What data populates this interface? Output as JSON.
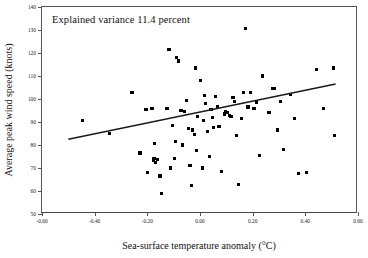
{
  "chart_data": {
    "type": "scatter",
    "title": "",
    "annotation": "Explained variance 11.4 percent",
    "xlabel": "Sea-surface temperature anomaly (°C)",
    "ylabel": "Average peak wind speed (knots)",
    "xlim": [
      -0.6,
      0.6
    ],
    "ylim": [
      50,
      140
    ],
    "xticks": [
      "-0.60",
      "-0.40",
      "-0.20",
      "0.00",
      "0.20",
      "0.40",
      "0.60"
    ],
    "xtick_values": [
      -0.6,
      -0.4,
      -0.2,
      0.0,
      0.2,
      0.4,
      0.6
    ],
    "yticks": [
      "50",
      "60",
      "70",
      "80",
      "90",
      "100",
      "110",
      "120",
      "130",
      "140"
    ],
    "ytick_values": [
      50,
      60,
      70,
      80,
      90,
      100,
      110,
      120,
      130,
      140
    ],
    "grid": false,
    "legend": false,
    "marker": "square",
    "marker_color": "#000000",
    "trendline": {
      "label": "linear-regression-line",
      "color": "#1a1a1a",
      "x_start": -0.5,
      "y_start": 82.5,
      "x_end": 0.515,
      "y_end": 106.5
    },
    "points": [
      [
        -0.445,
        90.5
      ],
      [
        -0.345,
        85.0
      ],
      [
        -0.258,
        103.0
      ],
      [
        -0.228,
        76.5
      ],
      [
        -0.205,
        95.5
      ],
      [
        -0.198,
        68.0
      ],
      [
        -0.182,
        96.0
      ],
      [
        -0.178,
        73.5
      ],
      [
        -0.175,
        74.0
      ],
      [
        -0.172,
        80.5
      ],
      [
        -0.168,
        72.5
      ],
      [
        -0.162,
        73.8
      ],
      [
        -0.152,
        66.5
      ],
      [
        -0.147,
        59.0
      ],
      [
        -0.125,
        96.0
      ],
      [
        -0.118,
        121.5
      ],
      [
        -0.112,
        70.0
      ],
      [
        -0.105,
        88.5
      ],
      [
        -0.098,
        74.0
      ],
      [
        -0.092,
        81.5
      ],
      [
        -0.088,
        118.0
      ],
      [
        -0.082,
        116.5
      ],
      [
        -0.072,
        95.0
      ],
      [
        -0.065,
        80.0
      ],
      [
        -0.058,
        94.5
      ],
      [
        -0.052,
        99.5
      ],
      [
        -0.045,
        87.0
      ],
      [
        -0.038,
        71.0
      ],
      [
        -0.032,
        62.5
      ],
      [
        -0.028,
        86.5
      ],
      [
        -0.022,
        84.5
      ],
      [
        -0.018,
        113.5
      ],
      [
        -0.012,
        77.5
      ],
      [
        -0.008,
        92.5
      ],
      [
        0.002,
        108.0
      ],
      [
        0.008,
        70.0
      ],
      [
        0.012,
        90.5
      ],
      [
        0.018,
        101.5
      ],
      [
        0.022,
        98.0
      ],
      [
        0.028,
        86.0
      ],
      [
        0.035,
        75.0
      ],
      [
        0.042,
        95.5
      ],
      [
        0.048,
        92.0
      ],
      [
        0.052,
        87.5
      ],
      [
        0.058,
        101.0
      ],
      [
        0.065,
        96.5
      ],
      [
        0.072,
        88.0
      ],
      [
        0.082,
        68.5
      ],
      [
        0.092,
        93.5
      ],
      [
        0.098,
        94.5
      ],
      [
        0.105,
        94.0
      ],
      [
        0.112,
        93.0
      ],
      [
        0.118,
        92.5
      ],
      [
        0.125,
        100.5
      ],
      [
        0.132,
        99.0
      ],
      [
        0.138,
        84.0
      ],
      [
        0.145,
        63.0
      ],
      [
        0.158,
        91.5
      ],
      [
        0.165,
        103.0
      ],
      [
        0.172,
        130.5
      ],
      [
        0.182,
        96.5
      ],
      [
        0.192,
        103.0
      ],
      [
        0.205,
        96.0
      ],
      [
        0.215,
        98.5
      ],
      [
        0.225,
        75.5
      ],
      [
        0.238,
        110.0
      ],
      [
        0.262,
        94.0
      ],
      [
        0.275,
        104.5
      ],
      [
        0.282,
        104.5
      ],
      [
        0.295,
        86.5
      ],
      [
        0.305,
        99.0
      ],
      [
        0.318,
        78.0
      ],
      [
        0.345,
        102.0
      ],
      [
        0.358,
        91.5
      ],
      [
        0.375,
        67.5
      ],
      [
        0.405,
        68.0
      ],
      [
        0.442,
        113.0
      ],
      [
        0.468,
        96.0
      ],
      [
        0.508,
        113.5
      ],
      [
        0.512,
        84.0
      ]
    ]
  }
}
